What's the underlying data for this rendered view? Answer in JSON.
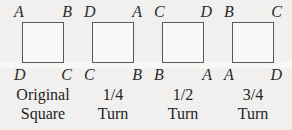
{
  "figure": {
    "colors": {
      "background": "#f1f0ee",
      "square_border": "#58585a",
      "square_fill": "#faf9f7",
      "text": "#242424"
    },
    "panels": [
      {
        "top_left": "A",
        "top_right": "B",
        "bottom_left": "D",
        "bottom_right": "C",
        "caption_line1": "Original",
        "caption_line2": "Square"
      },
      {
        "top_left": "D",
        "top_right": "A",
        "bottom_left": "C",
        "bottom_right": "B",
        "caption_line1": "1/4",
        "caption_line2": "Turn"
      },
      {
        "top_left": "C",
        "top_right": "D",
        "bottom_left": "B",
        "bottom_right": "A",
        "caption_line1": "1/2",
        "caption_line2": "Turn"
      },
      {
        "top_left": "B",
        "top_right": "C",
        "bottom_left": "A",
        "bottom_right": "D",
        "caption_line1": "3/4",
        "caption_line2": "Turn"
      }
    ]
  }
}
